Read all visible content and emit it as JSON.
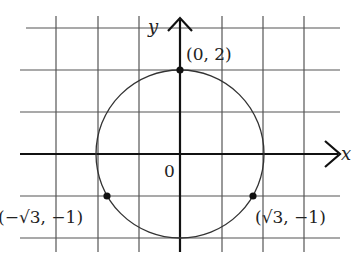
{
  "diagram": {
    "type": "coordinate-plane-circle",
    "axes": {
      "x_label": "x",
      "y_label": "y",
      "origin_label": "0"
    },
    "circle": {
      "center": [
        0,
        0
      ],
      "radius": 2
    },
    "points": [
      {
        "label": "(0, 2)",
        "x": 0,
        "y": 2
      },
      {
        "label": "(−√3, −1)",
        "x": -1.732,
        "y": -1
      },
      {
        "label": "(√3, −1)",
        "x": 1.732,
        "y": -1
      }
    ],
    "grid": {
      "x_range": [
        -3,
        3
      ],
      "y_range": [
        -2,
        3
      ],
      "step": 1
    },
    "colors": {
      "grid": "#555555",
      "axis": "#111111",
      "circle": "#333333",
      "point": "#111111"
    }
  }
}
